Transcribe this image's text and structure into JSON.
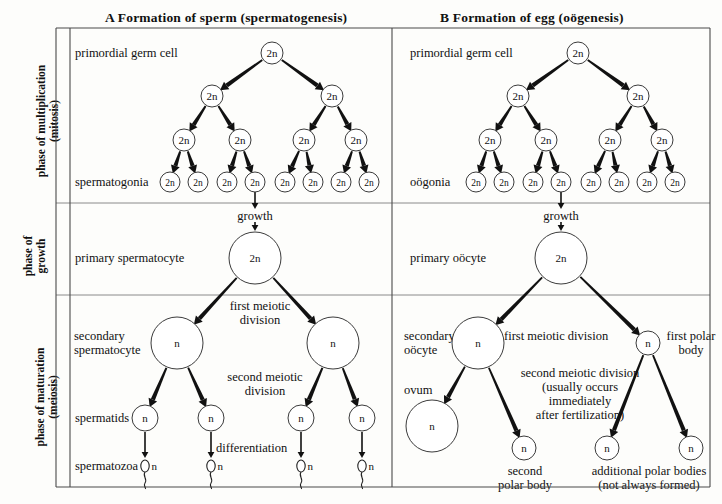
{
  "panels": {
    "a": {
      "title": "A  Formation of sperm (spermatogenesis)"
    },
    "b": {
      "title": "B  Formation of egg (oögenesis)"
    }
  },
  "phases": [
    {
      "id": "multiplication",
      "label": "phase of multiplication\n(mitosis)"
    },
    {
      "id": "growth",
      "label": "phase of\ngrowth"
    },
    {
      "id": "maturation",
      "label": "phase of maturation\n(meiosis)"
    }
  ],
  "sperm_side": {
    "primordial_germ_cell": "primordial germ cell",
    "spermatogonia": "spermatogonia",
    "growth": "growth",
    "primary_spermatocyte": "primary spermatocyte",
    "first_meiotic_division": "first meiotic\ndivision",
    "secondary_spermatocyte": "secondary\nspermatocyte",
    "second_meiotic_division": "second meiotic\ndivision",
    "spermatids": "spermatids",
    "differentiation": "differentiation",
    "spermatozoa": "spermatozoa"
  },
  "egg_side": {
    "primordial_germ_cell": "primordial germ cell",
    "oogonia": "oögonia",
    "growth": "growth",
    "primary_oocyte": "primary oöcyte",
    "first_meiotic_division": "first meiotic division",
    "secondary_oocyte": "secondary\noöcyte",
    "first_polar_body": "first polar\nbody",
    "second_meiotic_division": "second meiotic division\n(usually occurs\nimmediately\nafter fertilization)",
    "ovum": "ovum",
    "second_polar_body": "second\npolar body",
    "additional_polar_bodies": "additional polar bodies\n(not always formed)"
  },
  "ploidy": {
    "diploid": "2n",
    "haploid": "n"
  },
  "sperm_tree": {
    "root": {
      "x": 272,
      "y": 53,
      "r": 11,
      "label": "2n"
    },
    "level2": [
      {
        "x": 212,
        "y": 96,
        "r": 11,
        "label": "2n"
      },
      {
        "x": 332,
        "y": 96,
        "r": 11,
        "label": "2n"
      }
    ],
    "level3": [
      {
        "x": 184,
        "y": 140,
        "r": 11,
        "label": "2n"
      },
      {
        "x": 240,
        "y": 140,
        "r": 11,
        "label": "2n"
      },
      {
        "x": 304,
        "y": 140,
        "r": 11,
        "label": "2n"
      },
      {
        "x": 356,
        "y": 140,
        "r": 11,
        "label": "2n"
      }
    ],
    "level4": [
      {
        "x": 170,
        "y": 182,
        "r": 10,
        "label": "2n"
      },
      {
        "x": 198,
        "y": 182,
        "r": 10,
        "label": "2n"
      },
      {
        "x": 227,
        "y": 182,
        "r": 10,
        "label": "2n"
      },
      {
        "x": 255,
        "y": 182,
        "r": 10,
        "label": "2n"
      },
      {
        "x": 285,
        "y": 182,
        "r": 10,
        "label": "2n"
      },
      {
        "x": 313,
        "y": 182,
        "r": 10,
        "label": "2n"
      },
      {
        "x": 341,
        "y": 182,
        "r": 10,
        "label": "2n"
      },
      {
        "x": 369,
        "y": 182,
        "r": 10,
        "label": "2n"
      }
    ],
    "primary": {
      "x": 255,
      "y": 258,
      "r": 26,
      "label": "2n"
    },
    "secondary": [
      {
        "x": 177,
        "y": 343,
        "r": 26,
        "label": "n"
      },
      {
        "x": 333,
        "y": 343,
        "r": 26,
        "label": "n"
      }
    ],
    "spermatids": [
      {
        "x": 145,
        "y": 418,
        "r": 13,
        "label": "n"
      },
      {
        "x": 211,
        "y": 418,
        "r": 13,
        "label": "n"
      },
      {
        "x": 301,
        "y": 418,
        "r": 13,
        "label": "n"
      },
      {
        "x": 362,
        "y": 418,
        "r": 13,
        "label": "n"
      }
    ],
    "spermatozoa": [
      {
        "x": 145,
        "y": 466,
        "label": "n"
      },
      {
        "x": 211,
        "y": 466,
        "label": "n"
      },
      {
        "x": 301,
        "y": 466,
        "label": "n"
      },
      {
        "x": 362,
        "y": 466,
        "label": "n"
      }
    ]
  },
  "egg_tree": {
    "root": {
      "x": 578,
      "y": 53,
      "r": 11,
      "label": "2n"
    },
    "level2": [
      {
        "x": 518,
        "y": 96,
        "r": 11,
        "label": "2n"
      },
      {
        "x": 638,
        "y": 96,
        "r": 11,
        "label": "2n"
      }
    ],
    "level3": [
      {
        "x": 490,
        "y": 140,
        "r": 11,
        "label": "2n"
      },
      {
        "x": 546,
        "y": 140,
        "r": 11,
        "label": "2n"
      },
      {
        "x": 610,
        "y": 140,
        "r": 11,
        "label": "2n"
      },
      {
        "x": 662,
        "y": 140,
        "r": 11,
        "label": "2n"
      }
    ],
    "level4": [
      {
        "x": 476,
        "y": 182,
        "r": 10,
        "label": "2n"
      },
      {
        "x": 504,
        "y": 182,
        "r": 10,
        "label": "2n"
      },
      {
        "x": 533,
        "y": 182,
        "r": 10,
        "label": "2n"
      },
      {
        "x": 561,
        "y": 182,
        "r": 10,
        "label": "2n"
      },
      {
        "x": 591,
        "y": 182,
        "r": 10,
        "label": "2n"
      },
      {
        "x": 619,
        "y": 182,
        "r": 10,
        "label": "2n"
      },
      {
        "x": 647,
        "y": 182,
        "r": 10,
        "label": "2n"
      },
      {
        "x": 675,
        "y": 182,
        "r": 10,
        "label": "2n"
      }
    ],
    "primary": {
      "x": 561,
      "y": 258,
      "r": 26,
      "label": "2n"
    },
    "secondary_oocyte": {
      "x": 478,
      "y": 343,
      "r": 26,
      "label": "n"
    },
    "first_polar_body": {
      "x": 648,
      "y": 343,
      "r": 12,
      "label": "n"
    },
    "ovum": {
      "x": 432,
      "y": 426,
      "r": 26,
      "label": "n"
    },
    "second_polar_body": {
      "x": 524,
      "y": 448,
      "r": 12,
      "label": "n"
    },
    "additional_polar_bodies": [
      {
        "x": 607,
        "y": 448,
        "r": 12,
        "label": "n"
      },
      {
        "x": 691,
        "y": 448,
        "r": 12,
        "label": "n"
      }
    ]
  },
  "frame": {
    "left": 56,
    "right": 710,
    "top": 28,
    "bottom": 487,
    "divider_x": 392,
    "row1_y": 203,
    "row2_y": 295,
    "label_col_x": 56,
    "label_col_right": 70
  },
  "colors": {
    "ink": "#111111",
    "frame": "#4a4a4a",
    "circle_stroke": "#3b3b3b",
    "background": "#fdfdfb"
  }
}
